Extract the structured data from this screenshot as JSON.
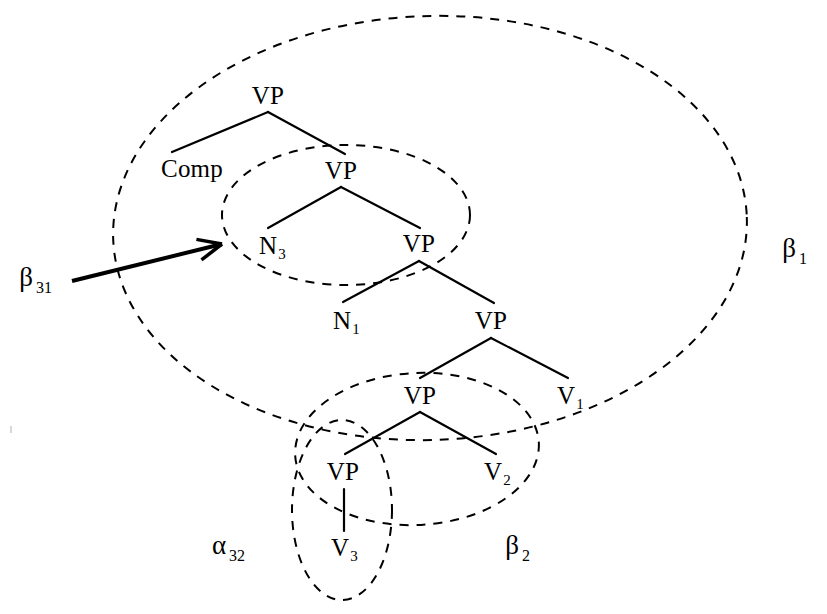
{
  "figure": {
    "type": "tree-adjoining-grammar-derived-tree",
    "background_color": "#ffffff",
    "stroke_color": "#000000"
  },
  "tree": {
    "nodes": [
      {
        "id": "vp-top",
        "label": "VP",
        "sub": "",
        "x": 268,
        "y": 95
      },
      {
        "id": "comp",
        "label": "Comp",
        "sub": "",
        "x": 192,
        "y": 168
      },
      {
        "id": "vp-2",
        "label": "VP",
        "sub": "",
        "x": 341,
        "y": 170
      },
      {
        "id": "n3",
        "label": "N",
        "sub": "3",
        "x": 272,
        "y": 245
      },
      {
        "id": "vp-3",
        "label": "VP",
        "sub": "",
        "x": 419,
        "y": 243
      },
      {
        "id": "n1",
        "label": "N",
        "sub": "1",
        "x": 346,
        "y": 320
      },
      {
        "id": "vp-4",
        "label": "VP",
        "sub": "",
        "x": 491,
        "y": 320
      },
      {
        "id": "vp-5",
        "label": "VP",
        "sub": "",
        "x": 420,
        "y": 395
      },
      {
        "id": "v1",
        "label": "V",
        "sub": "1",
        "x": 570,
        "y": 395
      },
      {
        "id": "vp-6",
        "label": "VP",
        "sub": "",
        "x": 343,
        "y": 471
      },
      {
        "id": "v2",
        "label": "V",
        "sub": "2",
        "x": 497,
        "y": 471
      },
      {
        "id": "v3",
        "label": "V",
        "sub": "3",
        "x": 344,
        "y": 547
      }
    ],
    "edges": [
      {
        "from": "vp-top",
        "to": "comp",
        "x1": 268,
        "y1": 112,
        "x2": 172,
        "y2": 152
      },
      {
        "from": "vp-top",
        "to": "vp-2",
        "x1": 268,
        "y1": 112,
        "x2": 345,
        "y2": 154
      },
      {
        "from": "vp-2",
        "to": "n3",
        "x1": 341,
        "y1": 187,
        "x2": 268,
        "y2": 228
      },
      {
        "from": "vp-2",
        "to": "vp-3",
        "x1": 341,
        "y1": 187,
        "x2": 420,
        "y2": 228
      },
      {
        "from": "vp-3",
        "to": "n1",
        "x1": 419,
        "y1": 261,
        "x2": 343,
        "y2": 302
      },
      {
        "from": "vp-3",
        "to": "vp-4",
        "x1": 419,
        "y1": 261,
        "x2": 494,
        "y2": 303
      },
      {
        "from": "vp-4",
        "to": "vp-5",
        "x1": 491,
        "y1": 338,
        "x2": 420,
        "y2": 378
      },
      {
        "from": "vp-4",
        "to": "v1",
        "x1": 491,
        "y1": 338,
        "x2": 568,
        "y2": 378
      },
      {
        "from": "vp-5",
        "to": "vp-6",
        "x1": 420,
        "y1": 412,
        "x2": 345,
        "y2": 454
      },
      {
        "from": "vp-5",
        "to": "v2",
        "x1": 420,
        "y1": 412,
        "x2": 496,
        "y2": 454
      },
      {
        "from": "vp-6",
        "to": "v3",
        "x1": 344,
        "y1": 489,
        "x2": 344,
        "y2": 531
      }
    ]
  },
  "sets": [
    {
      "id": "beta1",
      "label": "β",
      "sub": "1",
      "label_x": 793,
      "label_y": 248,
      "ellipse": {
        "cx": 430,
        "cy": 228,
        "rx": 317,
        "ry": 212,
        "rotate": -2
      }
    },
    {
      "id": "beta31",
      "label": "β",
      "sub": "31",
      "label_x": 34,
      "label_y": 277,
      "ellipse": {
        "cx": 346,
        "cy": 215,
        "rx": 124,
        "ry": 70,
        "rotate": 0
      }
    },
    {
      "id": "beta2",
      "label": "β",
      "sub": "2",
      "label_x": 516,
      "label_y": 545,
      "ellipse": {
        "cx": 417,
        "cy": 449,
        "rx": 122,
        "ry": 76,
        "rotate": -3
      }
    },
    {
      "id": "alpha32",
      "label": "α",
      "sub": "32",
      "label_x": 227,
      "label_y": 545,
      "ellipse": {
        "cx": 342,
        "cy": 510,
        "rx": 50,
        "ry": 90,
        "rotate": 0
      }
    }
  ],
  "arrow": {
    "id": "beta31-pointer",
    "x1": 72,
    "y1": 281,
    "x2": 222,
    "y2": 244,
    "head_length": 26,
    "head_width": 9
  }
}
